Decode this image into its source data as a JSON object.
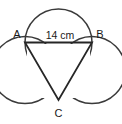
{
  "figure": {
    "name": "three-tangent-circles-with-inscribed-triangle",
    "background_color": "#ffffff",
    "stroke_color": "#3a3a3a",
    "triangle_stroke_color": "#262626"
  },
  "labels": {
    "vertex_a": "A",
    "vertex_b": "B",
    "vertex_c": "C",
    "dimension_ab": "14 cm"
  },
  "geometry": {
    "circle_radius": 33.5,
    "circles": [
      {
        "name": "top-circle",
        "cx": 58.5,
        "cy": 42.5,
        "r": 33.5
      },
      {
        "name": "left-circle",
        "cx": 25.0,
        "cy": 70.0,
        "r": 33.5
      },
      {
        "name": "right-circle",
        "cx": 92.0,
        "cy": 70.0,
        "r": 33.5
      }
    ],
    "triangle": {
      "name": "triangle-abc",
      "vertices": [
        {
          "label": "A",
          "x": 25.0,
          "y": 42.5
        },
        {
          "label": "B",
          "x": 92.0,
          "y": 42.5
        },
        {
          "label": "C",
          "x": 58.5,
          "y": 100.0
        }
      ],
      "side_length_label": "14 cm",
      "path": "M 25 42.5 L 92 42.5 L 58.5 100 Z"
    },
    "label_positions": {
      "a": {
        "x": 17,
        "y": 38
      },
      "b": {
        "x": 99,
        "y": 38
      },
      "c": {
        "x": 58.5,
        "y": 118
      },
      "dimension": {
        "x": 58.5,
        "y": 38
      }
    }
  }
}
